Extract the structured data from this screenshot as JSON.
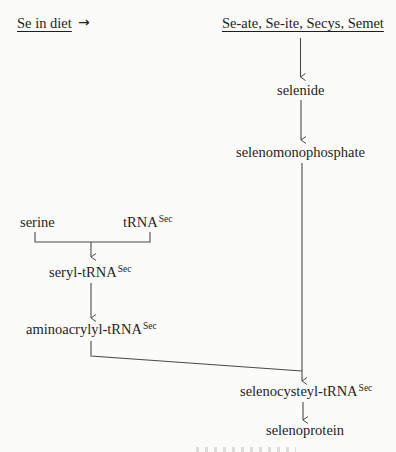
{
  "diagram": {
    "colors": {
      "background": "#fbfbf9",
      "text": "#1e1e1e",
      "lines": "#4a4a4a"
    },
    "source_label": "Se in diet",
    "source_arrow": "→",
    "sources_list": "Se-ate, Se-ite, Secys, Semet",
    "nodes": {
      "selenide": "selenide",
      "selenomonophosphate": "selenomonophosphate",
      "serine": "serine",
      "trna": {
        "base": "tRNA",
        "sup": "Sec"
      },
      "seryl_trna": {
        "base": "seryl-tRNA",
        "sup": "Sec"
      },
      "aminoacrylyl_trna": {
        "base": "aminoacrylyl-tRNA",
        "sup": "Sec"
      },
      "selenocysteyl_trna": {
        "base": "selenocysteyl-tRNA",
        "sup": "Sec"
      },
      "selenoprotein": "selenoprotein"
    },
    "edges": [
      {
        "from": "sources_list",
        "to": "selenide"
      },
      {
        "from": "selenide",
        "to": "selenomonophosphate"
      },
      {
        "from": "serine",
        "to": "seryl_trna",
        "join": "trna"
      },
      {
        "from": "seryl_trna",
        "to": "aminoacrylyl_trna"
      },
      {
        "from": "aminoacrylyl_trna",
        "to": "selenocysteyl_trna",
        "join": "selenomonophosphate"
      },
      {
        "from": "selenocysteyl_trna",
        "to": "selenoprotein"
      }
    ]
  }
}
